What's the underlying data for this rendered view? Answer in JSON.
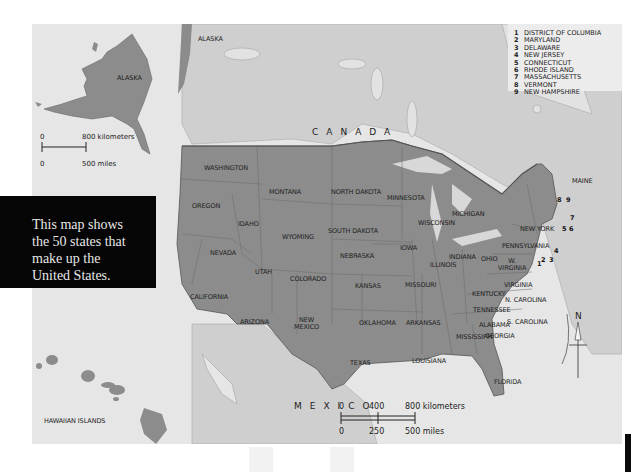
{
  "map": {
    "title": "United States political map",
    "country_labels": {
      "canada": "CANADA",
      "mexico": "MEXICO",
      "alaska_main": "ALASKA"
    },
    "states": [
      {
        "id": "washington",
        "label": "WASHINGTON"
      },
      {
        "id": "oregon",
        "label": "OREGON"
      },
      {
        "id": "california",
        "label": "CALIFORNIA"
      },
      {
        "id": "nevada",
        "label": "NEVADA"
      },
      {
        "id": "idaho",
        "label": "IDAHO"
      },
      {
        "id": "montana",
        "label": "MONTANA"
      },
      {
        "id": "wyoming",
        "label": "WYOMING"
      },
      {
        "id": "utah",
        "label": "UTAH"
      },
      {
        "id": "arizona",
        "label": "ARIZONA"
      },
      {
        "id": "colorado",
        "label": "COLORADO"
      },
      {
        "id": "new_mexico",
        "label": "NEW MEXICO",
        "line1": "NEW",
        "line2": "MEXICO"
      },
      {
        "id": "north_dakota",
        "label": "NORTH DAKOTA"
      },
      {
        "id": "south_dakota",
        "label": "SOUTH DAKOTA"
      },
      {
        "id": "nebraska",
        "label": "NEBRASKA"
      },
      {
        "id": "kansas",
        "label": "KANSAS"
      },
      {
        "id": "oklahoma",
        "label": "OKLAHOMA"
      },
      {
        "id": "texas",
        "label": "TEXAS"
      },
      {
        "id": "minnesota",
        "label": "MINNESOTA"
      },
      {
        "id": "iowa",
        "label": "IOWA"
      },
      {
        "id": "missouri",
        "label": "MISSOURI"
      },
      {
        "id": "arkansas",
        "label": "ARKANSAS"
      },
      {
        "id": "louisiana",
        "label": "LOUISIANA"
      },
      {
        "id": "wisconsin",
        "label": "WISCONSIN"
      },
      {
        "id": "illinois",
        "label": "ILLINOIS"
      },
      {
        "id": "michigan",
        "label": "MICHIGAN"
      },
      {
        "id": "indiana",
        "label": "INDIANA"
      },
      {
        "id": "ohio",
        "label": "OHIO"
      },
      {
        "id": "kentucky",
        "label": "KENTUCKY"
      },
      {
        "id": "tennessee",
        "label": "TENNESSEE"
      },
      {
        "id": "mississippi",
        "label": "MISSISSIPPI"
      },
      {
        "id": "alabama",
        "label": "ALABAMA"
      },
      {
        "id": "georgia",
        "label": "GEORGIA"
      },
      {
        "id": "florida",
        "label": "FLORIDA"
      },
      {
        "id": "south_carolina",
        "label": "S. CAROLINA"
      },
      {
        "id": "north_carolina",
        "label": "N. CAROLINA"
      },
      {
        "id": "virginia",
        "label": "VIRGINIA"
      },
      {
        "id": "west_virginia",
        "label": "W. VIRGINIA",
        "line1": "W.",
        "line2": "VIRGINIA"
      },
      {
        "id": "pennsylvania",
        "label": "PENNSYLVANIA"
      },
      {
        "id": "new_york",
        "label": "NEW YORK"
      },
      {
        "id": "maine",
        "label": "MAINE"
      }
    ],
    "small_state_markers": [
      "1",
      "2",
      "3",
      "4",
      "5",
      "6",
      "7",
      "8",
      "9"
    ],
    "legend": [
      {
        "num": "1",
        "name": "DISTRICT OF COLUMBIA"
      },
      {
        "num": "2",
        "name": "MARYLAND"
      },
      {
        "num": "3",
        "name": "DELAWARE"
      },
      {
        "num": "4",
        "name": "NEW JERSEY"
      },
      {
        "num": "5",
        "name": "CONNECTICUT"
      },
      {
        "num": "6",
        "name": "RHODE ISLAND"
      },
      {
        "num": "7",
        "name": "MASSACHUSETTS"
      },
      {
        "num": "8",
        "name": "VERMONT"
      },
      {
        "num": "9",
        "name": "NEW HAMPSHIRE"
      }
    ],
    "alaska_inset": {
      "label": "ALASKA",
      "scale": {
        "km_zero": "0",
        "km_label": "800 kilometers",
        "mi_zero": "0",
        "mi_label": "500 miles"
      }
    },
    "hawaii_inset": {
      "label": "HAWAIIAN ISLANDS"
    },
    "main_scale": {
      "km": [
        "0",
        "400",
        "800 kilometers"
      ],
      "mi": [
        "0",
        "250",
        "500 miles"
      ]
    },
    "compass": {
      "label": "N"
    },
    "caption": {
      "lines": [
        "This map shows",
        "the 50 states that",
        "make up the",
        "United States."
      ]
    },
    "colors": {
      "states": "#8c8c8c",
      "land_other": "#cfcfcf",
      "water": "#e9e9e9",
      "border": "#555555",
      "caption_bg": "#050505",
      "caption_text": "#e8e8e8"
    }
  }
}
